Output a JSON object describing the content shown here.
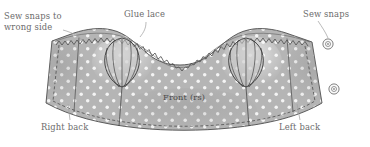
{
  "diagram": {
    "type": "sewing-pattern-illustration",
    "colors": {
      "fabric_fill": "#b5b5b5",
      "fabric_dot": "#f2f2f2",
      "outline": "#4d4d4d",
      "stitch_line": "#5a5a5a",
      "label_text": "#6b6b6b",
      "front_text": "#4a4a4a",
      "leader_line": "#9a9a9a",
      "snap_ring": "#6a6a6a",
      "background": "#ffffff"
    }
  },
  "labels": {
    "sew_snaps_wrong_side_line1": "Sew snaps to",
    "sew_snaps_wrong_side_line2": "wrong side",
    "glue_lace": "Glue lace",
    "sew_snaps": "Sew snaps",
    "right_back": "Right back",
    "left_back": "Left back",
    "front_rs": "Front (rs)"
  },
  "features": {
    "snaps_count": 2,
    "gathered_sections_count": 2,
    "lace_trim": "zigzag scalloped lace along top neckline edge",
    "fabric_pattern": "white polka dots on gray",
    "hem_edge": "curved dashed stitch line along bottom",
    "side_edges": "dashed stitch lines inset from left and right edges"
  }
}
